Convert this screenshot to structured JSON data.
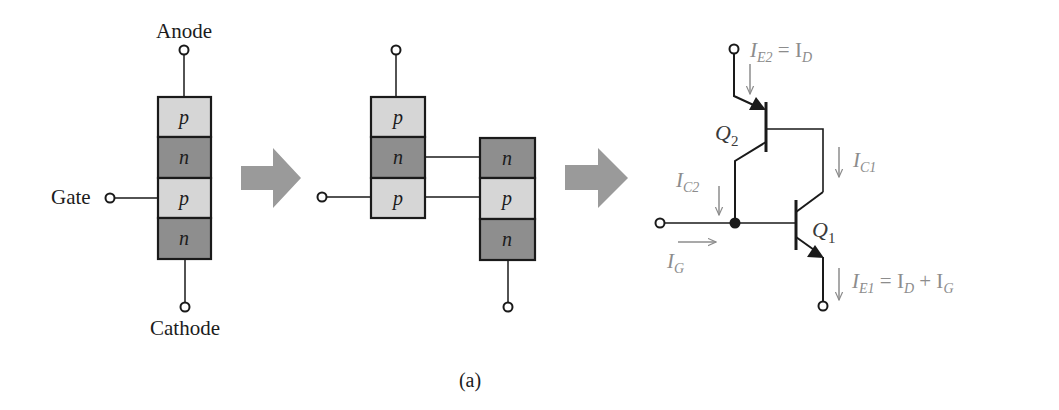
{
  "figure": {
    "caption": "(a)",
    "colors": {
      "line": "#1a1a1a",
      "p_layer": "#d6d6d6",
      "n_layer": "#8e8e8e",
      "arrow": "#9a9a9a",
      "current_label": "#8c8c8c"
    }
  },
  "structure": {
    "anode_label": "Anode",
    "gate_label": "Gate",
    "cathode_label": "Cathode",
    "layers": [
      {
        "type": "p",
        "label": "p"
      },
      {
        "type": "n",
        "label": "n"
      },
      {
        "type": "p",
        "label": "p"
      },
      {
        "type": "n",
        "label": "n"
      }
    ]
  },
  "split": {
    "left_layers": [
      {
        "type": "p",
        "label": "p"
      },
      {
        "type": "n",
        "label": "n"
      },
      {
        "type": "p",
        "label": "p"
      }
    ],
    "right_layers": [
      {
        "type": "n",
        "label": "n"
      },
      {
        "type": "p",
        "label": "p"
      },
      {
        "type": "n",
        "label": "n"
      }
    ]
  },
  "circuit": {
    "q2_label": "Q",
    "q2_sub": "2",
    "q1_label": "Q",
    "q1_sub": "1",
    "ie2": {
      "main": "I",
      "sub": "E2",
      "rest": " = I",
      "rest_sub": "D"
    },
    "ic1": {
      "main": "I",
      "sub": "C1"
    },
    "ic2": {
      "main": "I",
      "sub": "C2"
    },
    "ig": {
      "main": "I",
      "sub": "G"
    },
    "ie1": {
      "main": "I",
      "sub": "E1",
      "rest1": " = I",
      "rest1_sub": "D",
      "rest2": " + I",
      "rest2_sub": "G"
    }
  }
}
